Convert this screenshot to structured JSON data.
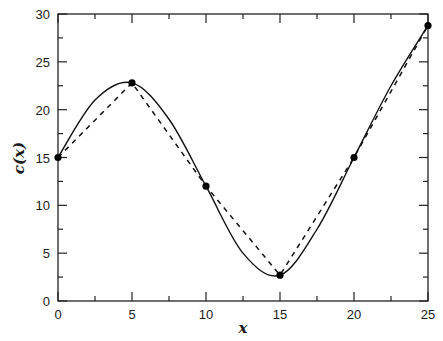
{
  "chart_data": {
    "type": "line",
    "title": "",
    "xlabel": "x",
    "ylabel": "c(x)",
    "xlim": [
      0,
      25
    ],
    "ylim": [
      0,
      30
    ],
    "x_ticks": [
      0,
      5,
      10,
      15,
      20,
      25
    ],
    "y_ticks": [
      0,
      5,
      10,
      15,
      20,
      25,
      30
    ],
    "grid": false,
    "legend": null,
    "points": {
      "x": [
        0,
        5,
        10,
        15,
        20,
        25
      ],
      "y": [
        15,
        22.8,
        12,
        2.7,
        15,
        28.8
      ]
    },
    "series": [
      {
        "name": "smooth curve",
        "style": "solid",
        "x": [
          0,
          2.5,
          5,
          7.5,
          10,
          12.5,
          15,
          17.5,
          20,
          22.5,
          25
        ],
        "values": [
          15,
          21,
          22.8,
          19,
          12,
          5,
          2.7,
          7.5,
          15,
          22.5,
          28.8
        ]
      },
      {
        "name": "piecewise linear",
        "style": "dashed",
        "x": [
          0,
          5,
          10,
          15,
          20,
          25
        ],
        "values": [
          15,
          22.8,
          12,
          2.7,
          15,
          28.8
        ]
      }
    ]
  },
  "labels": {
    "xlabel": "x",
    "ylabel": "c(x)",
    "xticks": [
      "0",
      "5",
      "10",
      "15",
      "20",
      "25"
    ],
    "yticks": [
      "0",
      "5",
      "10",
      "15",
      "20",
      "25",
      "30"
    ]
  }
}
